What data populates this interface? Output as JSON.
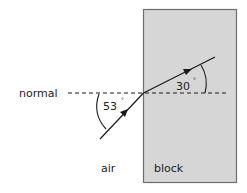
{
  "diagram": {
    "labels": {
      "normal": "normal",
      "air": "air",
      "block": "block",
      "incidence_angle": "53",
      "refraction_angle": "30",
      "degree_symbol": "°"
    },
    "colors": {
      "block_fill": "#d6d6d6",
      "block_border": "#6e6e6e",
      "line": "#1a1a1a",
      "text": "#222222"
    }
  }
}
